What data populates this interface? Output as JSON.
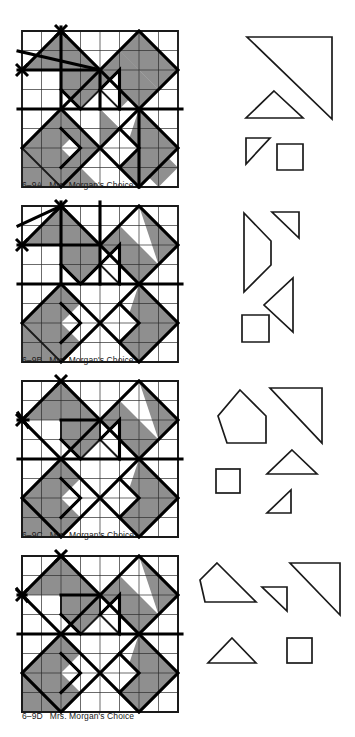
{
  "page": {
    "width": 355,
    "height": 737,
    "background": "#ffffff",
    "ink": "#1a1a1a",
    "shade_fill": "#8f8f8f",
    "grid_line": "#2b2b2b",
    "bold_line": "#000000"
  },
  "figures": [
    {
      "id": "fig-6-9a",
      "caption_id": "6–9A",
      "caption_title": "Mrs. Morgan's Choice",
      "block": {
        "name": "Mrs. Morgan's Choice",
        "grid": "8x8",
        "size_px": 156,
        "origin": {
          "x": 22,
          "y": 31
        }
      },
      "templates": [
        {
          "name": "large-right-triangle",
          "shape": "triangle",
          "points": "0,0 55,0 55,52"
        },
        {
          "name": "medium-isosceles-triangle",
          "shape": "triangle",
          "points": "27,0 54,27 0,27"
        },
        {
          "name": "small-right-triangle",
          "shape": "triangle",
          "points": "0,0 24,0 0,26"
        },
        {
          "name": "square",
          "shape": "square",
          "points": "0,0 26,0 26,26 0,26"
        }
      ]
    },
    {
      "id": "fig-6-9b",
      "caption_id": "6–9B",
      "caption_title": "Mrs. Morgan's Choice",
      "block": {
        "name": "Mrs. Morgan's Choice",
        "grid": "8x8",
        "size_px": 156,
        "origin": {
          "x": 22,
          "y": 206
        }
      },
      "templates": [
        {
          "name": "trapezoid",
          "shape": "quadrilateral",
          "points": "0,0 27,27 27,52 0,79"
        },
        {
          "name": "small-right-triangle",
          "shape": "triangle",
          "points": "0,0 27,0 27,26"
        },
        {
          "name": "left-pointing-triangle",
          "shape": "triangle",
          "points": "29,0 29,54 0,27"
        },
        {
          "name": "square",
          "shape": "square",
          "points": "0,0 27,0 27,27 0,27"
        }
      ]
    },
    {
      "id": "fig-6-9c",
      "caption_id": "6–9C",
      "caption_title": "Mrs. Morgan's Choice",
      "block": {
        "name": "Mrs. Morgan's Choice",
        "grid": "8x8",
        "size_px": 156,
        "origin": {
          "x": 22,
          "y": 381
        }
      },
      "templates": [
        {
          "name": "pentagon",
          "shape": "pentagon",
          "points": "22,0 48,26 48,52 9,52 0,26"
        },
        {
          "name": "large-right-triangle",
          "shape": "triangle",
          "points": "0,0 52,0 52,52"
        },
        {
          "name": "isosceles-triangle",
          "shape": "triangle",
          "points": "25,0 50,24 0,24"
        },
        {
          "name": "square",
          "shape": "square",
          "points": "0,0 23,0 23,24 0,24"
        },
        {
          "name": "small-right-triangle",
          "shape": "triangle",
          "points": "24,0 24,23 0,23"
        }
      ]
    },
    {
      "id": "fig-6-9d",
      "caption_id": "6–9D",
      "caption_title": "Mrs. Morgan's Choice",
      "block": {
        "name": "Mrs. Morgan's Choice",
        "grid": "8x8",
        "size_px": 156,
        "origin": {
          "x": 22,
          "y": 556
        }
      },
      "templates": [
        {
          "name": "trapezoid",
          "shape": "quadrilateral",
          "points": "17,0 56,39 5,39 0,17"
        },
        {
          "name": "small-right-triangle",
          "shape": "triangle",
          "points": "0,0 25,0 25,24"
        },
        {
          "name": "large-right-triangle",
          "shape": "triangle",
          "points": "0,0 50,0 50,52"
        },
        {
          "name": "isosceles-triangle",
          "shape": "triangle",
          "points": "24,0 48,25 0,25"
        },
        {
          "name": "square",
          "shape": "square",
          "points": "0,0 25,0 25,25 0,25"
        }
      ]
    }
  ]
}
